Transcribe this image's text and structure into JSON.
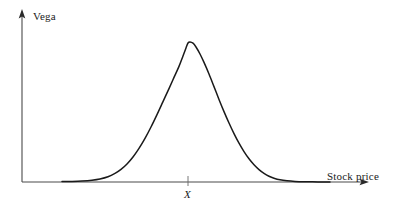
{
  "chart_data": {
    "type": "line",
    "title": "",
    "subtitle": "",
    "xlabel": "Stock price",
    "ylabel": "Vega",
    "grid": false,
    "legend": null,
    "annotations": [
      {
        "name": "strike-price-tick",
        "label": "X",
        "style": "italic",
        "x_axis_position": 188,
        "description": "Tick mark on stock-price axis at the strike price, located under the curve peak"
      }
    ],
    "axes": {
      "x": {
        "label": "Stock price",
        "arrow": true,
        "ticks": [
          "X"
        ],
        "tick_labels_visible": true,
        "origin_px": [
          22,
          182
        ],
        "end_px": [
          368,
          182
        ]
      },
      "y": {
        "label": "Vega",
        "arrow": true,
        "ticks": [],
        "tick_labels_visible": false,
        "origin_px": [
          22,
          182
        ],
        "end_px": [
          22,
          12
        ]
      }
    },
    "series": [
      {
        "name": "Vega",
        "shape": "bell-curve",
        "peak_x_label": "X",
        "peak_px": [
          188,
          42
        ],
        "baseline_px_y": 182,
        "left_tail_start_px_x": 62,
        "right_tail_end_px_x": 330,
        "points": [
          [
            62,
            181.6
          ],
          [
            72,
            181.4
          ],
          [
            82,
            181.0
          ],
          [
            92,
            180.2
          ],
          [
            100,
            179.0
          ],
          [
            108,
            176.8
          ],
          [
            115,
            173.4
          ],
          [
            121,
            169.4
          ],
          [
            127,
            164.0
          ],
          [
            133,
            157.0
          ],
          [
            139,
            148.4
          ],
          [
            145,
            138.4
          ],
          [
            151,
            127.0
          ],
          [
            157,
            114.6
          ],
          [
            163,
            101.6
          ],
          [
            169,
            88.6
          ],
          [
            174,
            77.4
          ],
          [
            179,
            66.4
          ],
          [
            183,
            56.0
          ],
          [
            186,
            48.0
          ],
          [
            188,
            43.0
          ],
          [
            190,
            42.0
          ],
          [
            193,
            43.2
          ],
          [
            196,
            47.0
          ],
          [
            200,
            54.0
          ],
          [
            204,
            62.4
          ],
          [
            209,
            74.0
          ],
          [
            214,
            86.6
          ],
          [
            219,
            99.4
          ],
          [
            224,
            111.6
          ],
          [
            229,
            123.0
          ],
          [
            234,
            133.6
          ],
          [
            239,
            143.2
          ],
          [
            244,
            151.6
          ],
          [
            249,
            158.8
          ],
          [
            254,
            164.8
          ],
          [
            259,
            169.6
          ],
          [
            264,
            173.4
          ],
          [
            269,
            176.2
          ],
          [
            274,
            178.2
          ],
          [
            280,
            179.8
          ],
          [
            287,
            180.8
          ],
          [
            295,
            181.4
          ],
          [
            305,
            181.7
          ],
          [
            318,
            181.9
          ],
          [
            330,
            182.0
          ]
        ]
      }
    ],
    "colors": {
      "curve": "#1a1a1a",
      "axis": "#4a4a4a",
      "text": "#1a1a1a",
      "background": "#ffffff"
    }
  },
  "labels": {
    "y_axis": "Vega",
    "x_axis": "Stock price",
    "strike": "X"
  }
}
